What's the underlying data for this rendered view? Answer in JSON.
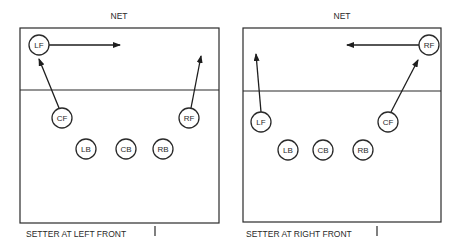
{
  "diagrams": [
    {
      "net_label": "NET",
      "caption": "SETTER AT LEFT FRONT",
      "players": [
        {
          "label": "LF",
          "x": 39,
          "y": 45
        },
        {
          "label": "CF",
          "x": 62,
          "y": 118
        },
        {
          "label": "RF",
          "x": 189,
          "y": 118
        },
        {
          "label": "LB",
          "x": 86,
          "y": 149
        },
        {
          "label": "CB",
          "x": 126,
          "y": 149
        },
        {
          "label": "RB",
          "x": 163,
          "y": 149
        }
      ],
      "arrows": [
        {
          "from": "LF",
          "x1": 49,
          "y1": 45,
          "x2": 120,
          "y2": 45
        },
        {
          "from": "CF",
          "x1": 59,
          "y1": 108,
          "x2": 39,
          "y2": 59
        },
        {
          "from": "RF",
          "x1": 191,
          "y1": 108,
          "x2": 201,
          "y2": 56
        }
      ]
    },
    {
      "net_label": "NET",
      "caption": "SETTER AT RIGHT FRONT",
      "players": [
        {
          "label": "RF",
          "x": 429,
          "y": 45
        },
        {
          "label": "LF",
          "x": 261,
          "y": 122
        },
        {
          "label": "CF",
          "x": 388,
          "y": 122
        },
        {
          "label": "LB",
          "x": 288,
          "y": 150
        },
        {
          "label": "CB",
          "x": 323,
          "y": 150
        },
        {
          "label": "RB",
          "x": 363,
          "y": 150
        }
      ],
      "arrows": [
        {
          "from": "RF",
          "x1": 419,
          "y1": 45,
          "x2": 347,
          "y2": 45
        },
        {
          "from": "LF",
          "x1": 261,
          "y1": 112,
          "x2": 256,
          "y2": 54
        },
        {
          "from": "CF",
          "x1": 391,
          "y1": 112,
          "x2": 418,
          "y2": 60
        }
      ]
    }
  ],
  "colors": {
    "ink": "#2a2a2a",
    "background": "#ffffff"
  }
}
